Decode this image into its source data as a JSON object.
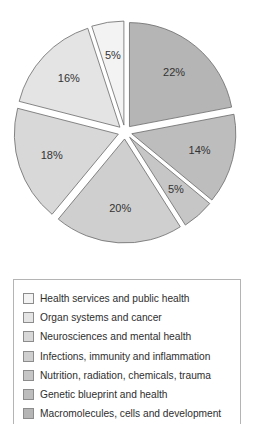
{
  "chart_data": {
    "type": "pie",
    "title": "",
    "start": "12 o'clock",
    "direction": "clockwise",
    "exploded": true,
    "legend_position": "bottom",
    "slices": [
      {
        "label": "Macromolecules, cells and development",
        "value": 22,
        "display": "22%",
        "color": "#b5b5b5"
      },
      {
        "label": "Genetic blueprint and health",
        "value": 14,
        "display": "14%",
        "color": "#bdbdbd"
      },
      {
        "label": "Nutrition, radiation, chemicals, trauma",
        "value": 5,
        "display": "5%",
        "color": "#c6c6c6"
      },
      {
        "label": "Infections, immunity and inflammation",
        "value": 20,
        "display": "20%",
        "color": "#cfcfcf"
      },
      {
        "label": "Neurosciences and mental health",
        "value": 18,
        "display": "18%",
        "color": "#d8d8d8"
      },
      {
        "label": "Organ systems and cancer",
        "value": 16,
        "display": "16%",
        "color": "#e4e4e4"
      },
      {
        "label": "Health services and public health",
        "value": 5,
        "display": "5%",
        "color": "#f3f3f3"
      }
    ]
  },
  "legend": {
    "items": [
      {
        "label": "Health services and public health",
        "color": "#f3f3f3"
      },
      {
        "label": "Organ systems and cancer",
        "color": "#e4e4e4"
      },
      {
        "label": "Neurosciences and mental health",
        "color": "#d8d8d8"
      },
      {
        "label": "Infections, immunity and inflammation",
        "color": "#cfcfcf"
      },
      {
        "label": "Nutrition, radiation, chemicals, trauma",
        "color": "#c6c6c6"
      },
      {
        "label": "Genetic blueprint and health",
        "color": "#bdbdbd"
      },
      {
        "label": "Macromolecules, cells and development",
        "color": "#b5b5b5"
      }
    ]
  }
}
